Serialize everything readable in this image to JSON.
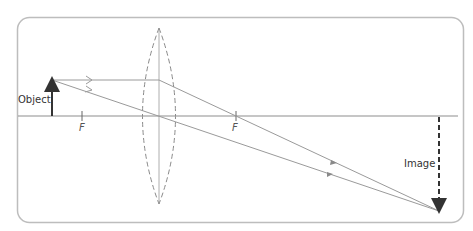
{
  "diagram": {
    "type": "ray-diagram-converging-lens",
    "labels": {
      "object": "Object",
      "image": "Image",
      "focal_left": "F",
      "focal_right": "F"
    },
    "colors": {
      "frame": "#b8b8b8",
      "rays": "#9a9a9a",
      "arrows": "#333333",
      "lens": "#888888"
    }
  }
}
